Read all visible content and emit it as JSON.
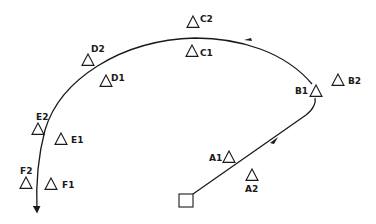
{
  "diagram": {
    "start": {
      "shape": "square",
      "x": 179,
      "y": 194,
      "w": 14,
      "h": 13
    },
    "route_description": "Path starts at square, runs up-right past A1/A2 to B1, then arcs left over C1/C2, D1/D2, and down past E1/E2 and F1/F2 ending in an arrow.",
    "markers": [
      {
        "id": "A1",
        "label": "A1",
        "x": 229,
        "y": 157,
        "lx": 209,
        "ly": 161
      },
      {
        "id": "A2",
        "label": "A2",
        "x": 252,
        "y": 175,
        "lx": 245,
        "ly": 192
      },
      {
        "id": "B1",
        "label": "B1",
        "x": 316,
        "y": 91,
        "lx": 295,
        "ly": 94
      },
      {
        "id": "B2",
        "label": "B2",
        "x": 338,
        "y": 80,
        "lx": 348,
        "ly": 84
      },
      {
        "id": "C1",
        "label": "C1",
        "x": 192,
        "y": 51,
        "lx": 200,
        "ly": 56
      },
      {
        "id": "C2",
        "label": "C2",
        "x": 193,
        "y": 22,
        "lx": 200,
        "ly": 22
      },
      {
        "id": "D1",
        "label": "D1",
        "x": 106,
        "y": 81,
        "lx": 111,
        "ly": 81
      },
      {
        "id": "D2",
        "label": "D2",
        "x": 88,
        "y": 60,
        "lx": 91,
        "ly": 52
      },
      {
        "id": "E1",
        "label": "E1",
        "x": 61,
        "y": 139,
        "lx": 71,
        "ly": 143
      },
      {
        "id": "E2",
        "label": "E2",
        "x": 38,
        "y": 129,
        "lx": 36,
        "ly": 120
      },
      {
        "id": "F1",
        "label": "F1",
        "x": 51,
        "y": 184,
        "lx": 62,
        "ly": 188
      },
      {
        "id": "F2",
        "label": "F2",
        "x": 26,
        "y": 183,
        "lx": 20,
        "ly": 174
      }
    ],
    "colors": {
      "stroke": "#1a1a1a",
      "background": "#ffffff"
    }
  }
}
